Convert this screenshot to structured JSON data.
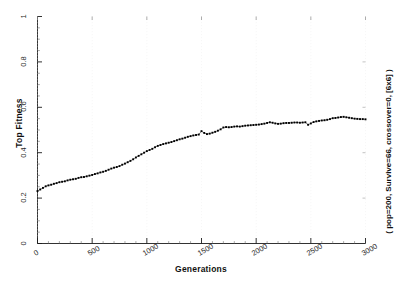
{
  "chart_data": {
    "type": "scatter",
    "title": "",
    "xlabel": "Generations",
    "ylabel": "Top Fitness",
    "annotation": "( pop=200, Survive=66, crossover=0, [6x6] )",
    "grid": false,
    "legend": "none",
    "marker": "square-dot",
    "color": "#000000",
    "xlim": [
      0,
      3000
    ],
    "ylim": [
      0,
      1
    ],
    "xticks": [
      0,
      500,
      1000,
      1500,
      2000,
      2500,
      3000
    ],
    "xtick_labels": [
      "0",
      "500",
      "1000",
      "1500",
      "2000",
      "2500",
      "3000"
    ],
    "yticks": [
      0,
      0.2,
      0.4,
      0.6,
      0.8,
      1
    ],
    "ytick_labels": [
      "0",
      "0.2",
      "0.4",
      "0.6",
      "0.8",
      "1"
    ],
    "series": [
      {
        "name": "Top Fitness",
        "x": [
          0,
          25,
          50,
          75,
          100,
          125,
          150,
          175,
          200,
          225,
          250,
          275,
          300,
          325,
          350,
          375,
          400,
          425,
          450,
          475,
          500,
          525,
          550,
          575,
          600,
          625,
          650,
          675,
          700,
          725,
          750,
          775,
          800,
          825,
          850,
          875,
          900,
          925,
          950,
          975,
          1000,
          1025,
          1050,
          1075,
          1100,
          1125,
          1150,
          1175,
          1200,
          1225,
          1250,
          1275,
          1300,
          1325,
          1350,
          1375,
          1400,
          1425,
          1450,
          1475,
          1500,
          1525,
          1550,
          1575,
          1600,
          1625,
          1650,
          1675,
          1700,
          1725,
          1750,
          1775,
          1800,
          1825,
          1850,
          1875,
          1900,
          1925,
          1950,
          1975,
          2000,
          2025,
          2050,
          2075,
          2100,
          2125,
          2150,
          2175,
          2200,
          2225,
          2250,
          2275,
          2300,
          2325,
          2350,
          2375,
          2400,
          2425,
          2450,
          2475,
          2500,
          2525,
          2550,
          2575,
          2600,
          2625,
          2650,
          2675,
          2700,
          2725,
          2750,
          2775,
          2800,
          2825,
          2850,
          2875,
          2900,
          2925,
          2950,
          2975,
          3000
        ],
        "y": [
          0.231,
          0.238,
          0.245,
          0.252,
          0.256,
          0.259,
          0.263,
          0.266,
          0.27,
          0.272,
          0.274,
          0.278,
          0.281,
          0.283,
          0.285,
          0.289,
          0.292,
          0.293,
          0.296,
          0.299,
          0.302,
          0.306,
          0.309,
          0.313,
          0.316,
          0.32,
          0.325,
          0.33,
          0.334,
          0.337,
          0.341,
          0.347,
          0.352,
          0.358,
          0.364,
          0.371,
          0.379,
          0.386,
          0.393,
          0.4,
          0.407,
          0.412,
          0.417,
          0.424,
          0.43,
          0.434,
          0.438,
          0.441,
          0.444,
          0.447,
          0.451,
          0.455,
          0.459,
          0.462,
          0.466,
          0.47,
          0.473,
          0.476,
          0.478,
          0.48,
          0.495,
          0.487,
          0.482,
          0.484,
          0.488,
          0.492,
          0.497,
          0.503,
          0.511,
          0.513,
          0.512,
          0.513,
          0.515,
          0.516,
          0.515,
          0.517,
          0.519,
          0.52,
          0.521,
          0.522,
          0.523,
          0.524,
          0.526,
          0.528,
          0.531,
          0.534,
          0.532,
          0.529,
          0.527,
          0.528,
          0.53,
          0.531,
          0.531,
          0.532,
          0.533,
          0.533,
          0.532,
          0.533,
          0.534,
          0.523,
          0.529,
          0.535,
          0.538,
          0.54,
          0.542,
          0.543,
          0.545,
          0.548,
          0.552,
          0.553,
          0.555,
          0.557,
          0.558,
          0.556,
          0.554,
          0.552,
          0.55,
          0.549,
          0.548,
          0.548,
          0.547
        ]
      }
    ]
  }
}
